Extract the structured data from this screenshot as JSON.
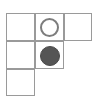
{
  "board": {
    "name": "tetromino-grid-board",
    "shape": "T-shape",
    "background_color": "#ffffff",
    "grid_line_color": "#9a9a9a",
    "cell_width": 29,
    "cell_height": 28,
    "origin_x": 6,
    "origin_y": 13,
    "rows": [
      {
        "row_index": 0,
        "cell_count": 3,
        "columns": [
          0,
          1,
          2
        ]
      },
      {
        "row_index": 1,
        "cell_count": 2,
        "columns": [
          0,
          1
        ]
      },
      {
        "row_index": 2,
        "cell_count": 1,
        "columns": [
          0
        ]
      }
    ],
    "cells": [
      {
        "id": "cell-r0c0",
        "row": 0,
        "col": 0,
        "x": 6,
        "y": 13,
        "w": 29,
        "h": 28,
        "content": "empty"
      },
      {
        "id": "cell-r0c1",
        "row": 0,
        "col": 1,
        "x": 35,
        "y": 13,
        "w": 29,
        "h": 28,
        "content": "hollow-circle"
      },
      {
        "id": "cell-r0c2",
        "row": 0,
        "col": 2,
        "x": 64,
        "y": 13,
        "w": 28,
        "h": 28,
        "content": "empty"
      },
      {
        "id": "cell-r1c0",
        "row": 1,
        "col": 0,
        "x": 6,
        "y": 41,
        "w": 29,
        "h": 28,
        "content": "empty"
      },
      {
        "id": "cell-r1c1",
        "row": 1,
        "col": 1,
        "x": 35,
        "y": 41,
        "w": 29,
        "h": 28,
        "content": "filled-circle"
      },
      {
        "id": "cell-r2c0",
        "row": 2,
        "col": 0,
        "x": 6,
        "y": 69,
        "w": 29,
        "h": 27,
        "content": "empty"
      }
    ],
    "pieces": [
      {
        "id": "piece-hollow-circle",
        "kind": "hollow-circle",
        "label": "white piece",
        "fill_color": "#ffffff",
        "stroke_color": "#7d7d7d",
        "stroke_width": 2,
        "x": 40,
        "y": 18,
        "size": 19,
        "cell": "cell-r0c1"
      },
      {
        "id": "piece-filled-circle",
        "kind": "filled-circle",
        "label": "dark piece",
        "fill_color": "#555555",
        "stroke_color": "#4a4a4a",
        "stroke_width": 1,
        "x": 40,
        "y": 46,
        "size": 20,
        "cell": "cell-r1c1"
      }
    ]
  }
}
